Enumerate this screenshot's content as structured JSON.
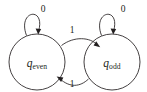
{
  "diagram": {
    "type": "finite-state-machine",
    "title": "",
    "background_color": "#ffffff",
    "stroke_color": "#231f20",
    "states": [
      {
        "id": "q_even",
        "base": "q",
        "subscript": "even",
        "cx": 37,
        "cy": 62,
        "r": 28,
        "accepting": false
      },
      {
        "id": "q_odd",
        "base": "q",
        "subscript": "odd",
        "cx": 112,
        "cy": 62,
        "r": 28,
        "accepting": false
      }
    ],
    "transitions": [
      {
        "id": "even-self-loop",
        "from": "q_even",
        "to": "q_even",
        "symbol": "0",
        "label_x": 43,
        "label_y": 10,
        "kind": "self-loop"
      },
      {
        "id": "odd-self-loop",
        "from": "q_odd",
        "to": "q_odd",
        "symbol": "0",
        "label_x": 123,
        "label_y": 10,
        "kind": "self-loop"
      },
      {
        "id": "even-to-odd",
        "from": "q_even",
        "to": "q_odd",
        "symbol": "1",
        "label_x": 72,
        "label_y": 31,
        "kind": "curve-top"
      },
      {
        "id": "odd-to-even",
        "from": "q_odd",
        "to": "q_even",
        "symbol": "1",
        "label_x": 72,
        "label_y": 85,
        "kind": "curve-bottom"
      }
    ]
  }
}
